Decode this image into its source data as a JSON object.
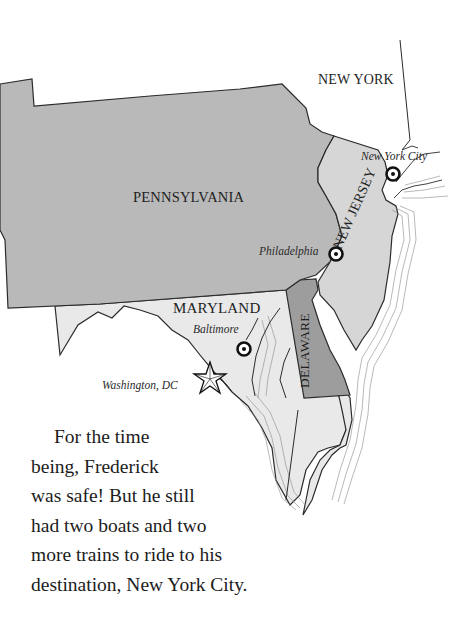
{
  "map": {
    "states": {
      "new_york": "NEW YORK",
      "pennsylvania": "PENNSYLVANIA",
      "new_jersey": "NEW JERSEY",
      "maryland": "MARYLAND",
      "delaware": "DELAWARE"
    },
    "cities": {
      "new_york_city": "New York City",
      "philadelphia": "Philadelphia",
      "baltimore": "Baltimore",
      "washington_dc": "Washington, DC"
    },
    "colors": {
      "pennsylvania_fill": "#b9b9b9",
      "new_jersey_fill": "#d6d6d6",
      "maryland_fill": "#e9e9e9",
      "delaware_fill": "#9d9d9d",
      "border": "#2b2b2b",
      "water_lines": "#8a8a8a"
    }
  },
  "story": {
    "lines": [
      "For the time",
      "being, Frederick",
      "was safe! But he still",
      "had two boats and two",
      "more trains to ride to his",
      "destination, New York City."
    ]
  }
}
